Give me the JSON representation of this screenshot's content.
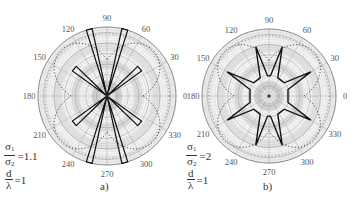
{
  "chart_data": [
    {
      "type": "polar",
      "panel_label": "a)",
      "angle_ticks": [
        0,
        30,
        60,
        90,
        120,
        150,
        180,
        210,
        240,
        270,
        300,
        330
      ],
      "angle_labels": [
        "0",
        "30",
        "60",
        "90",
        "120",
        "150",
        "180",
        "210",
        "240",
        "270",
        "300",
        "330"
      ],
      "parameters": [
        {
          "num": "σ",
          "num_sub": "1",
          "den": "σ",
          "den_sub": "2",
          "value": "=1.1"
        },
        {
          "num": "d",
          "num_sub": "",
          "den": "λ",
          "den_sub": "",
          "value": "=1"
        }
      ],
      "grid": true,
      "series": [
        {
          "name": "pattern (solid)",
          "style": "solid",
          "description": "narrow lobes along ~75°, 105°, 255°, 285° (full radius) and ~40°, 140°, 220°, 320° (about 0.6 radius)",
          "lobes": [
            {
              "angle": 75,
              "r": 1.0
            },
            {
              "angle": 105,
              "r": 1.0
            },
            {
              "angle": 255,
              "r": 1.0
            },
            {
              "angle": 285,
              "r": 1.0
            },
            {
              "angle": 40,
              "r": 0.62
            },
            {
              "angle": 140,
              "r": 0.62
            },
            {
              "angle": 220,
              "r": 0.62
            },
            {
              "angle": 320,
              "r": 0.62
            }
          ]
        },
        {
          "name": "reference (dashed)",
          "style": "dashed",
          "description": "four-petal dashed contour centered at 45°,135°,225°,315°"
        }
      ]
    },
    {
      "type": "polar",
      "panel_label": "b)",
      "angle_ticks": [
        0,
        30,
        60,
        90,
        120,
        150,
        180,
        210,
        240,
        270,
        300,
        330
      ],
      "angle_labels": [
        "0",
        "30",
        "60",
        "90",
        "120",
        "150",
        "180",
        "210",
        "240",
        "270",
        "300",
        "330"
      ],
      "parameters": [
        {
          "num": "σ",
          "num_sub": "1",
          "den": "σ",
          "den_sub": "2",
          "value": "=2"
        },
        {
          "num": "d",
          "num_sub": "",
          "den": "λ",
          "den_sub": "",
          "value": "=1"
        }
      ],
      "grid": true,
      "series": [
        {
          "name": "pattern (solid)",
          "style": "solid",
          "description": "star shaped with spikes at ~75°, 105°, 255°, 285° (r≈0.75) and ~30°, 150°, 210°, 330° (r≈0.7), inner octagon r≈0.3",
          "lobes": [
            {
              "angle": 75,
              "r": 0.76
            },
            {
              "angle": 105,
              "r": 0.76
            },
            {
              "angle": 255,
              "r": 0.76
            },
            {
              "angle": 285,
              "r": 0.76
            },
            {
              "angle": 30,
              "r": 0.72
            },
            {
              "angle": 150,
              "r": 0.72
            },
            {
              "angle": 210,
              "r": 0.72
            },
            {
              "angle": 330,
              "r": 0.72
            }
          ],
          "inner_radius": 0.3
        },
        {
          "name": "reference (dashed)",
          "style": "dashed",
          "description": "four-petal dashed contour centered at 45°,135°,225°,315°"
        }
      ]
    }
  ]
}
